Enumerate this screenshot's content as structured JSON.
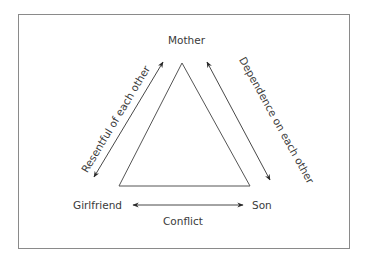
{
  "diagram": {
    "type": "triangle-relationship",
    "nodes": {
      "top": "Mother",
      "bottom_left": "Girlfriend",
      "bottom_right": "Son"
    },
    "edges": {
      "left": "Resentful of each other",
      "right": "Dependence on each other",
      "bottom": "Conflict"
    },
    "colors": {
      "line": "#3a3a3a",
      "frame": "#8a8a8a",
      "text": "#3a3a3a"
    }
  }
}
